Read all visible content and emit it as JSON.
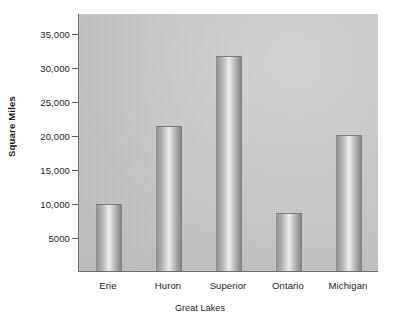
{
  "chart_data": {
    "type": "bar",
    "title": "",
    "subtitle": "",
    "xlabel": "Great Lakes",
    "ylabel": "Square Miles",
    "categories": [
      "Erie",
      "Huron",
      "Superior",
      "Ontario",
      "Michigan"
    ],
    "values": [
      9900,
      21400,
      31700,
      8500,
      20100
    ],
    "ylim": [
      0,
      38000
    ],
    "yticks": [
      5000,
      10000,
      15000,
      20000,
      25000,
      30000,
      35000
    ],
    "ytick_labels": [
      "5000",
      "10,000",
      "15,000",
      "20,000",
      "25,000",
      "30,000",
      "35,000"
    ],
    "grid": false,
    "legend": false,
    "legend_position": "none",
    "bar_style": "cylinder-gradient",
    "colors": {
      "plot_background": "#c7c7c5",
      "bar_light": "#ededeb",
      "bar_dark": "#8c8c8a",
      "axis_line": "#6e6e6e",
      "text": "#1a1a1a",
      "page_background": "#ffffff"
    }
  }
}
